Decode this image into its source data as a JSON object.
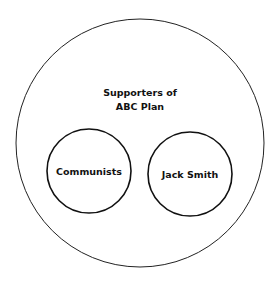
{
  "diagram": {
    "type": "euler",
    "outer_set": {
      "label_line1": "Supporters of",
      "label_line2": "ABC Plan"
    },
    "inner_sets": [
      {
        "label": "Communists"
      },
      {
        "label": "Jack Smith"
      }
    ],
    "stroke_color": "#111111",
    "background": "#ffffff"
  }
}
